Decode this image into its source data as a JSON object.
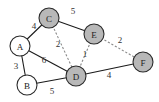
{
  "graph": {
    "colors": {
      "visited_fill": "#b8b8b8",
      "unvisited_fill": "#ffffff",
      "solid_edge": "#1a1a1a",
      "dashed_edge": "#8a8a8a"
    },
    "nodes": [
      {
        "id": "A",
        "label": "A",
        "x": 20,
        "y": 46,
        "visited": false
      },
      {
        "id": "B",
        "label": "B",
        "x": 27,
        "y": 85,
        "visited": false
      },
      {
        "id": "C",
        "label": "C",
        "x": 49,
        "y": 18,
        "visited": true
      },
      {
        "id": "D",
        "label": "D",
        "x": 76,
        "y": 76,
        "visited": true
      },
      {
        "id": "E",
        "label": "E",
        "x": 94,
        "y": 34,
        "visited": true
      },
      {
        "id": "F",
        "label": "F",
        "x": 143,
        "y": 62,
        "visited": true
      }
    ],
    "edges": [
      {
        "from": "A",
        "to": "C",
        "weight": "4",
        "style": "solid",
        "lx": 34,
        "ly": 26
      },
      {
        "from": "C",
        "to": "E",
        "weight": "5",
        "style": "solid",
        "lx": 73,
        "ly": 11
      },
      {
        "from": "C",
        "to": "D",
        "weight": "2",
        "style": "dashed",
        "lx": 58,
        "ly": 44
      },
      {
        "from": "E",
        "to": "D",
        "weight": "1",
        "style": "dashed",
        "lx": 85,
        "ly": 54
      },
      {
        "from": "E",
        "to": "F",
        "weight": "2",
        "style": "dashed",
        "lx": 120,
        "ly": 40
      },
      {
        "from": "A",
        "to": "D",
        "weight": "6",
        "style": "solid",
        "lx": 44,
        "ly": 60
      },
      {
        "from": "A",
        "to": "B",
        "weight": "3",
        "style": "solid",
        "lx": 16,
        "ly": 66
      },
      {
        "from": "B",
        "to": "D",
        "weight": "5",
        "style": "solid",
        "lx": 52,
        "ly": 91
      },
      {
        "from": "D",
        "to": "F",
        "weight": "4",
        "style": "solid",
        "lx": 109,
        "ly": 75
      }
    ]
  }
}
